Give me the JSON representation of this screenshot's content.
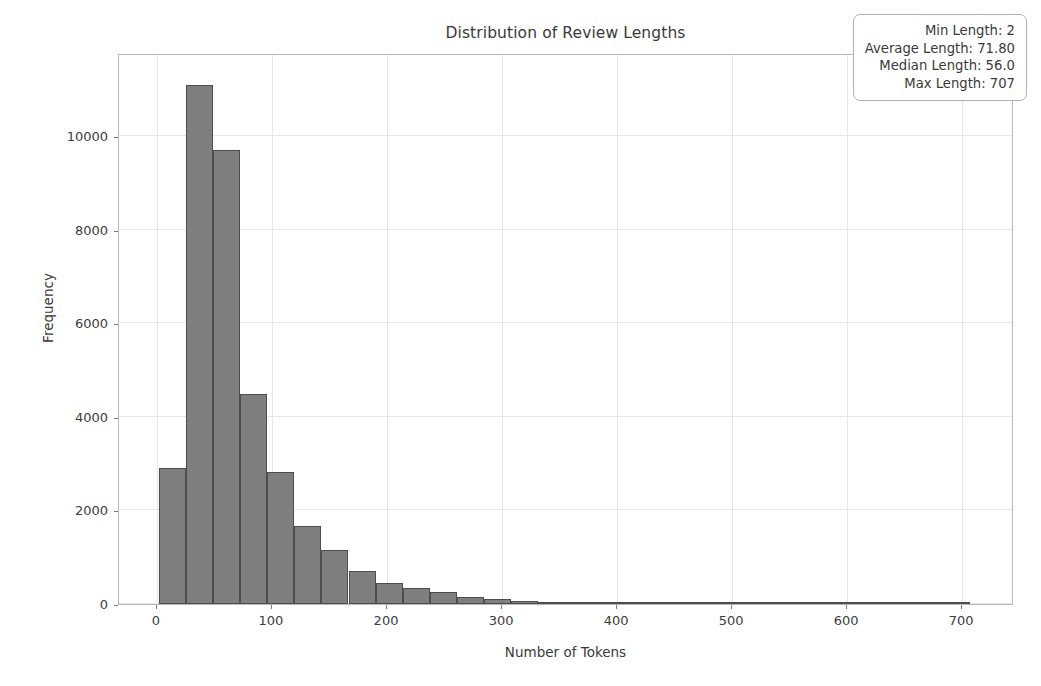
{
  "chart_data": {
    "type": "bar",
    "title": "Distribution of Review Lengths",
    "xlabel": "Number of Tokens",
    "ylabel": "Frequency",
    "xlim": [
      -33,
      745
    ],
    "ylim": [
      0,
      11780
    ],
    "grid": true,
    "bar_color": "#7f7f7f",
    "edge_color": "#4d4d4d",
    "bin_width": 23.5,
    "bin_start": 2,
    "xticks": [
      0,
      100,
      200,
      300,
      400,
      500,
      600,
      700
    ],
    "yticks": [
      0,
      2000,
      4000,
      6000,
      8000,
      10000
    ],
    "bins": [
      {
        "x0": 2,
        "x1": 25.5,
        "value": 2900
      },
      {
        "x0": 25.5,
        "x1": 49,
        "value": 11100
      },
      {
        "x0": 49,
        "x1": 72.5,
        "value": 9700
      },
      {
        "x0": 72.5,
        "x1": 96,
        "value": 4500
      },
      {
        "x0": 96,
        "x1": 119.5,
        "value": 2820
      },
      {
        "x0": 119.5,
        "x1": 143,
        "value": 1670
      },
      {
        "x0": 143,
        "x1": 166.5,
        "value": 1160
      },
      {
        "x0": 166.5,
        "x1": 190,
        "value": 700
      },
      {
        "x0": 190,
        "x1": 213.5,
        "value": 450
      },
      {
        "x0": 213.5,
        "x1": 237,
        "value": 345
      },
      {
        "x0": 237,
        "x1": 260.5,
        "value": 265
      },
      {
        "x0": 260.5,
        "x1": 284,
        "value": 150
      },
      {
        "x0": 284,
        "x1": 307.5,
        "value": 110
      },
      {
        "x0": 307.5,
        "x1": 331,
        "value": 65
      },
      {
        "x0": 331,
        "x1": 354.5,
        "value": 35
      },
      {
        "x0": 354.5,
        "x1": 378,
        "value": 18
      },
      {
        "x0": 378,
        "x1": 401.5,
        "value": 12
      },
      {
        "x0": 401.5,
        "x1": 425,
        "value": 8
      },
      {
        "x0": 425,
        "x1": 448.5,
        "value": 6
      },
      {
        "x0": 448.5,
        "x1": 472,
        "value": 5
      },
      {
        "x0": 472,
        "x1": 495.5,
        "value": 4
      },
      {
        "x0": 495.5,
        "x1": 519,
        "value": 3
      },
      {
        "x0": 519,
        "x1": 542.5,
        "value": 3
      },
      {
        "x0": 542.5,
        "x1": 566,
        "value": 2
      },
      {
        "x0": 566,
        "x1": 589.5,
        "value": 2
      },
      {
        "x0": 589.5,
        "x1": 613,
        "value": 1
      },
      {
        "x0": 613,
        "x1": 636.5,
        "value": 1
      },
      {
        "x0": 636.5,
        "x1": 660,
        "value": 1
      },
      {
        "x0": 660,
        "x1": 683.5,
        "value": 1
      },
      {
        "x0": 683.5,
        "x1": 707,
        "value": 1
      }
    ]
  },
  "stats_box": {
    "min_label": "Min Length: 2",
    "average_label": "Average Length: 71.80",
    "median_label": "Median Length: 56.0",
    "max_label": "Max Length: 707"
  }
}
